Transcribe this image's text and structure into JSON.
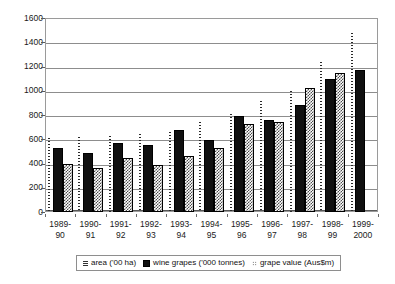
{
  "chart_data": {
    "type": "bar",
    "title": "",
    "xlabel": "",
    "ylabel": "",
    "ylim": [
      0,
      1600
    ],
    "ytick_step": 200,
    "grid": true,
    "legend_position": "bottom",
    "categories": [
      "1989-90",
      "1990-91",
      "1991-92",
      "1992-93",
      "1993-94",
      "1994-95",
      "1995-96",
      "1996-97",
      "1997-98",
      "1998-99",
      "1999-2000"
    ],
    "category_lines": [
      {
        "l1": "1989-",
        "l2": "90"
      },
      {
        "l1": "1990-",
        "l2": "91"
      },
      {
        "l1": "1991-",
        "l2": "92"
      },
      {
        "l1": "1992-",
        "l2": "93"
      },
      {
        "l1": "1993-",
        "l2": "94"
      },
      {
        "l1": "1994-",
        "l2": "95"
      },
      {
        "l1": "1995-",
        "l2": "96"
      },
      {
        "l1": "1996-",
        "l2": "97"
      },
      {
        "l1": "1997-",
        "l2": "98"
      },
      {
        "l1": "1998-",
        "l2": "99"
      },
      {
        "l1": "1999-",
        "l2": "2000"
      }
    ],
    "yticks": [
      0,
      200,
      400,
      600,
      800,
      1000,
      1200,
      1400,
      1600
    ],
    "series": [
      {
        "name": "area ('00 ha)",
        "marker": "dotted-line",
        "values": [
          610,
          620,
          630,
          640,
          660,
          740,
          810,
          915,
          1000,
          1235,
          1480
        ]
      },
      {
        "name": "wine grapes ('000 tonnes)",
        "marker": "solid-black-bar",
        "values": [
          525,
          490,
          570,
          550,
          675,
          590,
          795,
          760,
          885,
          1095,
          1170
        ]
      },
      {
        "name": "grape value (Aus$m)",
        "marker": "checkered-bar",
        "values": [
          400,
          365,
          445,
          385,
          460,
          530,
          725,
          745,
          1020,
          1145,
          null
        ]
      }
    ]
  },
  "legend": {
    "items": [
      {
        "label": "area ('00 ha)",
        "icon": "dotted-line-marker"
      },
      {
        "label": "wine grapes ('000 tonnes)",
        "icon": "filled-square-marker"
      },
      {
        "label": "grape value (Aus$m)",
        "icon": "dot-pattern-marker"
      }
    ]
  },
  "colors": {
    "wine_grapes": "#101010",
    "grape_value_pattern": "#4a4a4a",
    "area_line": "#2a2a2a",
    "gridline": "#8d8d8d",
    "frame": "#9a9a9a",
    "text": "#1a1a1a",
    "background": "#ffffff"
  }
}
